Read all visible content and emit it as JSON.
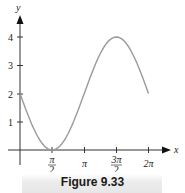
{
  "chart_data": {
    "type": "line",
    "title": "",
    "caption": "Figure 9.33",
    "xlabel": "x",
    "ylabel": "y",
    "x_ticks": [
      "π/2",
      "π",
      "3π/2",
      "2π"
    ],
    "y_ticks": [
      "1",
      "2",
      "3",
      "4"
    ],
    "xlim": [
      0,
      6.2832
    ],
    "ylim": [
      0,
      4
    ],
    "grid": false,
    "series": [
      {
        "name": "y = 2 - 2 sin x",
        "color": "#9a9a9a",
        "x": [
          0,
          0.3927,
          0.7854,
          1.1781,
          1.5708,
          1.9635,
          2.3562,
          2.7489,
          3.1416,
          3.5343,
          3.927,
          4.3197,
          4.7124,
          5.1051,
          5.4978,
          5.8905,
          6.2832
        ],
        "values": [
          2,
          1.235,
          0.586,
          0.152,
          0,
          0.152,
          0.586,
          1.235,
          2,
          2.765,
          3.414,
          3.848,
          4,
          3.848,
          3.414,
          2.765,
          2
        ]
      }
    ]
  },
  "labels": {
    "x_axis": "x",
    "y_axis": "y",
    "x_tick_pi_half_num": "π",
    "x_tick_pi_half_den": "2",
    "x_tick_pi": "π",
    "x_tick_3pi_half_num": "3π",
    "x_tick_3pi_half_den": "2",
    "x_tick_2pi": "2π",
    "y_tick_1": "1",
    "y_tick_2": "2",
    "y_tick_3": "3",
    "y_tick_4": "4"
  },
  "caption": "Figure 9.33"
}
